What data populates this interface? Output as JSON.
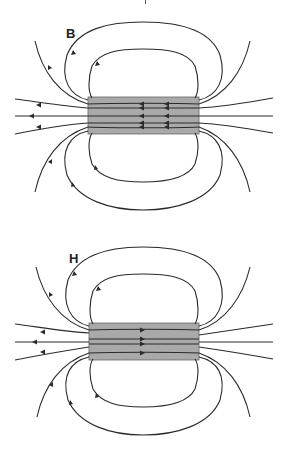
{
  "figure": {
    "panels": [
      {
        "label": "B",
        "field": "magnetic flux density",
        "description": "Field lines of B continuous through the magnet; inside arrows point left (from right end toward left), outside loops return",
        "interior_arrow_direction": "left",
        "interior_lines": 5
      },
      {
        "label": "H",
        "field": "magnetic field strength",
        "description": "Field lines of H: inside the magnet arrows point right (opposite to B), outside same as B",
        "interior_arrow_direction": "right",
        "interior_lines": 4
      }
    ],
    "colors": {
      "line": "#2a2a2a",
      "magnet_fill": "#a9a9a9",
      "magnet_stroke": "#555555",
      "background": "#ffffff"
    }
  }
}
